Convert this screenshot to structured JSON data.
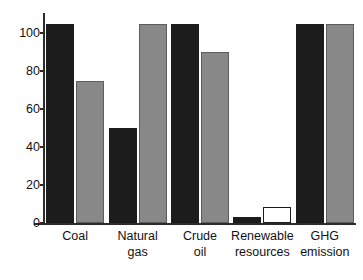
{
  "chart_data": {
    "type": "bar",
    "title": "",
    "subtitle": "",
    "xlabel": "",
    "ylabel": "",
    "categories": [
      "Coal",
      "Natural gas",
      "Crude oil",
      "Renewable resources",
      "GHG emission"
    ],
    "category_label_lines": [
      [
        "Coal"
      ],
      [
        "Natural",
        "gas"
      ],
      [
        "Crude",
        "oil"
      ],
      [
        "Renewable",
        "resources"
      ],
      [
        "GHG",
        "emission"
      ]
    ],
    "series": [
      {
        "name": "series-1",
        "color": "#1c1c1c",
        "style": "filled-dark",
        "values": [
          105,
          50,
          105,
          3,
          105
        ]
      },
      {
        "name": "series-2",
        "color": "#888888",
        "style": "filled-gray",
        "values": [
          75,
          105,
          90,
          8.5,
          105
        ]
      }
    ],
    "bar_styles": {
      "series_2_per_category": [
        "gray",
        "gray",
        "gray",
        "white",
        "gray"
      ]
    },
    "ylim": [
      0,
      110
    ],
    "yticks": [
      0,
      20,
      40,
      60,
      80,
      100
    ],
    "ytick_labels": [
      "0",
      "20",
      "40",
      "60",
      "80",
      "100"
    ],
    "grid": false,
    "legend": null,
    "legend_position": "none",
    "annotations": []
  },
  "axes": {
    "y_axis_color": "#2b2b2b",
    "x_axis_color": "#2b2b2b"
  },
  "colors": {
    "background": "#ffffff",
    "dark_bar": "#1c1c1c",
    "gray_bar": "#888888",
    "white_bar": "#ffffff",
    "outline": "#1c1c1c",
    "text": "#111111"
  }
}
